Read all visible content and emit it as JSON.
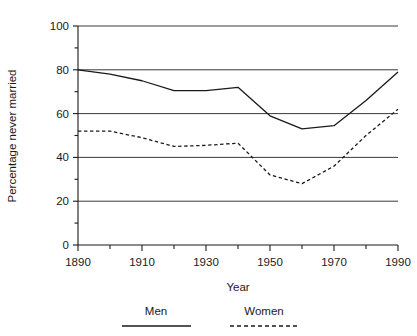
{
  "chart_data": {
    "type": "line",
    "title": "",
    "xlabel": "Year",
    "ylabel": "Percentage never married",
    "xlim": [
      1890,
      1990
    ],
    "ylim": [
      0,
      100
    ],
    "grid": true,
    "grid_axis": "y",
    "legend_position": "bottom",
    "x": [
      1890,
      1900,
      1910,
      1920,
      1930,
      1940,
      1950,
      1960,
      1970,
      1980,
      1990
    ],
    "xticks_major": [
      1890,
      1910,
      1930,
      1950,
      1970,
      1990
    ],
    "xticks_minor": [
      1900,
      1920,
      1940,
      1960,
      1980
    ],
    "xtick_labels": [
      "1890",
      "1910",
      "1930",
      "1950",
      "1970",
      "1990"
    ],
    "yticks_major": [
      0,
      20,
      40,
      60,
      80,
      100
    ],
    "yticks_minor": [
      10,
      30,
      50,
      70,
      90
    ],
    "ytick_labels": [
      "0",
      "20",
      "40",
      "60",
      "80",
      "100"
    ],
    "series": [
      {
        "name": "Men",
        "style": "solid",
        "color": "#1a1a1a",
        "values": [
          80,
          78,
          75,
          70.5,
          70.5,
          72,
          59,
          53,
          54.5,
          66,
          79
        ]
      },
      {
        "name": "Women",
        "style": "dashed",
        "color": "#1a1a1a",
        "values": [
          52,
          52,
          49,
          45,
          45.5,
          46.5,
          32,
          28,
          36,
          50,
          62
        ]
      }
    ]
  },
  "legend": {
    "entries": [
      {
        "label": "Men",
        "style": "solid"
      },
      {
        "label": "Women",
        "style": "dashed"
      }
    ]
  },
  "colors": {
    "background": "#ffffff",
    "ink": "#1a1a1a",
    "gridline": "#3a3a3a"
  }
}
